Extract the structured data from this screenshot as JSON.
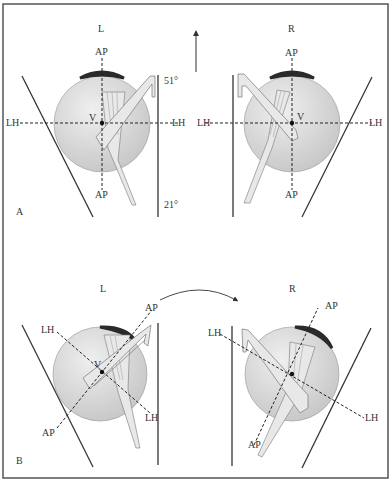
{
  "figure": {
    "panels": [
      {
        "id": "A",
        "label": "A",
        "eyes": [
          {
            "side": "L",
            "axis_top": "AP",
            "axis_bottom": "AP",
            "axis_left": "LH",
            "axis_right": "LH",
            "vertex": "V"
          },
          {
            "side": "R",
            "axis_top": "AP",
            "axis_bottom": "AP",
            "axis_left": "LH",
            "axis_right": "LH",
            "vertex": "V"
          }
        ],
        "angle_top": "51°",
        "angle_bottom": "21°"
      },
      {
        "id": "B",
        "label": "B",
        "eyes": [
          {
            "side": "L",
            "axis_ap_top": "AP",
            "axis_ap_bottom": "AP",
            "axis_lh_top": "LH",
            "axis_lh_bottom": "LH",
            "vertex": "V"
          },
          {
            "side": "R",
            "axis_ap_top": "AP",
            "axis_ap_bottom": "AP",
            "axis_lh_top": "LH",
            "axis_lh_bottom": "LH"
          }
        ]
      }
    ],
    "colors": {
      "frame": "#555555",
      "eye_fill": "#d4d4d4",
      "cap": "#2a2a2a",
      "line": "#333333",
      "instrument_fill": "#e8e8e8"
    }
  },
  "caption": {
    "text": ""
  }
}
